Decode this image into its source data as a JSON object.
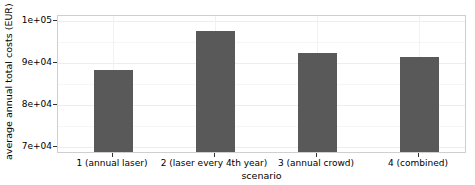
{
  "chart_data": {
    "type": "bar",
    "title": "",
    "xlabel": "scenario",
    "ylabel": "average annual total costs (EUR)",
    "categories": [
      "1 (annual laser)",
      "2 (laser every 4th year)",
      "3 (annual crowd)",
      "4 (combined)"
    ],
    "values": [
      87500,
      97500,
      91700,
      90700
    ],
    "ylim": [
      66500,
      101200
    ],
    "yticks": [
      70000,
      80000,
      90000,
      100000
    ],
    "ytick_labels": [
      "7e+04",
      "8e+04",
      "9e+04",
      "1e+05"
    ],
    "grid": true,
    "legend": null,
    "bar_color": "#595959",
    "panel_border_color": "#cfcfcf",
    "grid_major_color": "#ededed",
    "grid_minor_color": "#f6f6f6"
  }
}
